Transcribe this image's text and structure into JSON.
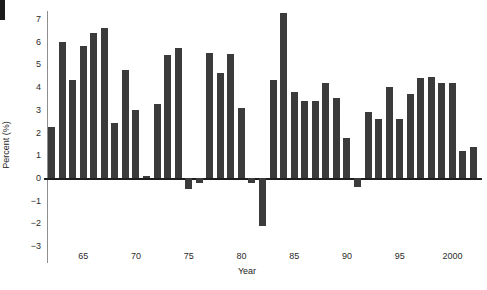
{
  "chart_data": {
    "type": "bar",
    "title": "",
    "xlabel": "Year",
    "ylabel": "Percent (%)",
    "ylim": [
      -3,
      8
    ],
    "ytick_values": [
      8,
      7,
      6,
      5,
      4,
      3,
      2,
      1,
      0,
      -1,
      -2,
      -3
    ],
    "ytick_labels": [
      "8",
      "7",
      "6",
      "5",
      "4",
      "3",
      "2",
      "1",
      "0",
      "−1",
      "−2",
      "−3"
    ],
    "xtick_values": [
      65,
      70,
      75,
      80,
      85,
      90,
      95,
      2000
    ],
    "xtick_labels": [
      "65",
      "70",
      "75",
      "80",
      "85",
      "90",
      "95",
      "2000"
    ],
    "grid": false,
    "legend": null,
    "bar_color": "#3b3b3b",
    "axis_color": "#8e8e8e",
    "zero_line_color": "#1d1d1d",
    "categories": [
      1962,
      1963,
      1964,
      1965,
      1966,
      1967,
      1968,
      1969,
      1970,
      1971,
      1972,
      1973,
      1974,
      1975,
      1976,
      1977,
      1978,
      1979,
      1980,
      1981,
      1982,
      1983,
      1984,
      1985,
      1986,
      1987,
      1988,
      1989,
      1990,
      1991,
      1992,
      1993,
      1994,
      1995,
      1996,
      1997,
      1998,
      1999,
      2000,
      2001,
      2002
    ],
    "values": [
      2.25,
      6.0,
      4.3,
      5.8,
      6.4,
      6.6,
      2.4,
      4.75,
      3.0,
      0.1,
      3.25,
      5.4,
      5.7,
      -0.5,
      -0.2,
      5.5,
      4.6,
      5.45,
      3.1,
      -0.2,
      -2.1,
      4.3,
      7.25,
      3.8,
      3.4,
      3.4,
      4.2,
      3.5,
      1.75,
      -0.4,
      2.9,
      2.6,
      4.0,
      2.6,
      3.7,
      4.4,
      4.45,
      4.2,
      4.2,
      1.2,
      1.35
    ]
  }
}
